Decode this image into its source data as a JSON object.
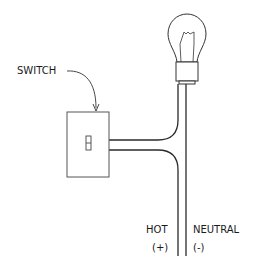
{
  "diagram": {
    "labels": {
      "switch": "SWITCH",
      "hot": "HOT",
      "hot_sign": "(+)",
      "neutral": "NEUTRAL",
      "neutral_sign": "(-)"
    },
    "components": [
      "light-bulb",
      "switch",
      "hot-wire",
      "neutral-wire"
    ],
    "colors": {
      "line": "#2a2a2a",
      "switch_outline": "#666666"
    }
  }
}
